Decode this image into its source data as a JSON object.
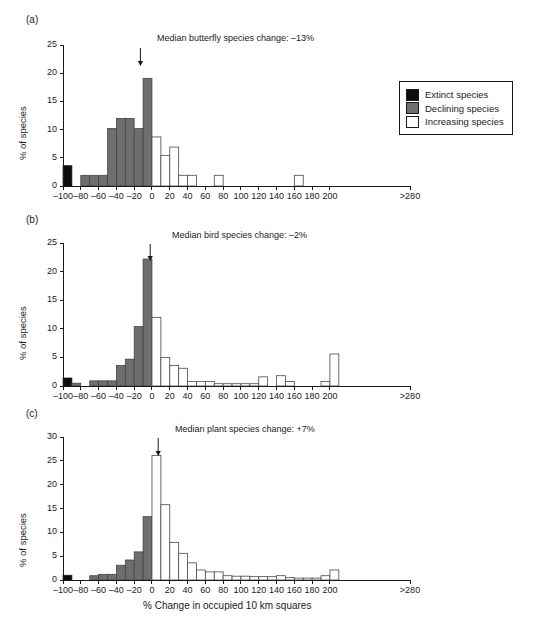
{
  "figure": {
    "xlabel": "% Change in occupied 10 km squares",
    "legend": {
      "items": [
        {
          "label": "Extinct species",
          "color": "#0d0d0d",
          "key": "extinct"
        },
        {
          "label": "Declining species",
          "color": "#6e6e6e",
          "key": "declining"
        },
        {
          "label": "Increasing species",
          "color": "#ffffff",
          "key": "increasing"
        }
      ]
    }
  },
  "chart_data": [
    {
      "type": "bar",
      "panel": "(a)",
      "title": "Median butterfly species change: –13%",
      "median": -13,
      "ylabel": "% of species",
      "xlabel": "",
      "ylim": [
        0,
        25
      ],
      "yticks": [
        0,
        5,
        10,
        15,
        20,
        25
      ],
      "yticklabels": [
        "0",
        "5",
        "10",
        "15",
        "20",
        "25"
      ],
      "xlim": [
        -100,
        290
      ],
      "xticks": [
        -100,
        -80,
        -60,
        -40,
        -20,
        0,
        20,
        40,
        60,
        80,
        100,
        120,
        140,
        160,
        180,
        200,
        290
      ],
      "xticklabels": [
        "–100",
        "–80",
        "–60",
        "–40",
        "–20",
        "0",
        "20",
        "40",
        "60",
        "80",
        "100",
        "120",
        "140",
        "160",
        "180",
        "200",
        ">280"
      ],
      "bin_width": 10,
      "bins": [
        {
          "x0": -100,
          "x1": -90,
          "value": 3.6,
          "cls": "extinct"
        },
        {
          "x0": -90,
          "x1": -80,
          "value": 0,
          "cls": "declining"
        },
        {
          "x0": -80,
          "x1": -70,
          "value": 1.9,
          "cls": "declining"
        },
        {
          "x0": -70,
          "x1": -60,
          "value": 1.9,
          "cls": "declining"
        },
        {
          "x0": -60,
          "x1": -50,
          "value": 1.9,
          "cls": "declining"
        },
        {
          "x0": -50,
          "x1": -40,
          "value": 10.2,
          "cls": "declining"
        },
        {
          "x0": -40,
          "x1": -30,
          "value": 12.0,
          "cls": "declining"
        },
        {
          "x0": -30,
          "x1": -20,
          "value": 12.0,
          "cls": "declining"
        },
        {
          "x0": -20,
          "x1": -10,
          "value": 10.2,
          "cls": "declining"
        },
        {
          "x0": -10,
          "x1": 0,
          "value": 19.1,
          "cls": "declining"
        },
        {
          "x0": 0,
          "x1": 10,
          "value": 8.7,
          "cls": "increasing"
        },
        {
          "x0": 10,
          "x1": 20,
          "value": 5.4,
          "cls": "increasing"
        },
        {
          "x0": 20,
          "x1": 30,
          "value": 6.9,
          "cls": "increasing"
        },
        {
          "x0": 30,
          "x1": 40,
          "value": 1.9,
          "cls": "increasing"
        },
        {
          "x0": 40,
          "x1": 50,
          "value": 1.9,
          "cls": "increasing"
        },
        {
          "x0": 70,
          "x1": 80,
          "value": 1.9,
          "cls": "increasing"
        },
        {
          "x0": 160,
          "x1": 170,
          "value": 1.9,
          "cls": "increasing"
        }
      ]
    },
    {
      "type": "bar",
      "panel": "(b)",
      "title": "Median bird species change: –2%",
      "median": -2,
      "ylabel": "% of species",
      "xlabel": "",
      "ylim": [
        0,
        25
      ],
      "yticks": [
        0,
        5,
        10,
        15,
        20,
        25
      ],
      "yticklabels": [
        "0",
        "5",
        "10",
        "15",
        "20",
        "25"
      ],
      "xlim": [
        -100,
        290
      ],
      "xticks": [
        -100,
        -80,
        -60,
        -40,
        -20,
        0,
        20,
        40,
        60,
        80,
        100,
        120,
        140,
        160,
        180,
        200,
        290
      ],
      "xticklabels": [
        "–100",
        "–80",
        "–60",
        "–40",
        "–20",
        "0",
        "20",
        "40",
        "60",
        "80",
        "100",
        "120",
        "140",
        "160",
        "180",
        "200",
        ">280"
      ],
      "bin_width": 10,
      "bins": [
        {
          "x0": -100,
          "x1": -90,
          "value": 1.4,
          "cls": "extinct"
        },
        {
          "x0": -90,
          "x1": -80,
          "value": 0.5,
          "cls": "declining"
        },
        {
          "x0": -80,
          "x1": -70,
          "value": 0,
          "cls": "declining"
        },
        {
          "x0": -70,
          "x1": -60,
          "value": 0.9,
          "cls": "declining"
        },
        {
          "x0": -60,
          "x1": -50,
          "value": 0.9,
          "cls": "declining"
        },
        {
          "x0": -50,
          "x1": -40,
          "value": 0.9,
          "cls": "declining"
        },
        {
          "x0": -40,
          "x1": -30,
          "value": 3.6,
          "cls": "declining"
        },
        {
          "x0": -30,
          "x1": -20,
          "value": 4.7,
          "cls": "declining"
        },
        {
          "x0": -20,
          "x1": -10,
          "value": 10.4,
          "cls": "declining"
        },
        {
          "x0": -10,
          "x1": 0,
          "value": 22.2,
          "cls": "declining"
        },
        {
          "x0": 0,
          "x1": 10,
          "value": 12.0,
          "cls": "increasing"
        },
        {
          "x0": 10,
          "x1": 20,
          "value": 5.0,
          "cls": "increasing"
        },
        {
          "x0": 20,
          "x1": 30,
          "value": 3.6,
          "cls": "increasing"
        },
        {
          "x0": 30,
          "x1": 40,
          "value": 3.1,
          "cls": "increasing"
        },
        {
          "x0": 40,
          "x1": 50,
          "value": 0.8,
          "cls": "increasing"
        },
        {
          "x0": 50,
          "x1": 60,
          "value": 0.8,
          "cls": "increasing"
        },
        {
          "x0": 60,
          "x1": 70,
          "value": 0.8,
          "cls": "increasing"
        },
        {
          "x0": 70,
          "x1": 80,
          "value": 0.4,
          "cls": "increasing"
        },
        {
          "x0": 80,
          "x1": 90,
          "value": 0.4,
          "cls": "increasing"
        },
        {
          "x0": 90,
          "x1": 100,
          "value": 0.4,
          "cls": "increasing"
        },
        {
          "x0": 100,
          "x1": 110,
          "value": 0.4,
          "cls": "increasing"
        },
        {
          "x0": 110,
          "x1": 120,
          "value": 0.4,
          "cls": "increasing"
        },
        {
          "x0": 120,
          "x1": 130,
          "value": 1.6,
          "cls": "increasing"
        },
        {
          "x0": 140,
          "x1": 150,
          "value": 1.8,
          "cls": "increasing"
        },
        {
          "x0": 150,
          "x1": 160,
          "value": 0.8,
          "cls": "increasing"
        },
        {
          "x0": 190,
          "x1": 200,
          "value": 0.8,
          "cls": "increasing"
        },
        {
          "x0": 200,
          "x1": 210,
          "value": 5.6,
          "cls": "increasing"
        }
      ]
    },
    {
      "type": "bar",
      "panel": "(c)",
      "title": "Median plant species change: +7%",
      "median": 7,
      "ylabel": "% of species",
      "xlabel": "% Change in occupied 10 km squares",
      "ylim": [
        0,
        30
      ],
      "yticks": [
        0,
        5,
        10,
        15,
        20,
        25,
        30
      ],
      "yticklabels": [
        "0",
        "5",
        "10",
        "15",
        "20",
        "25",
        "30"
      ],
      "xlim": [
        -100,
        290
      ],
      "xticks": [
        -100,
        -80,
        -60,
        -40,
        -20,
        0,
        20,
        40,
        60,
        80,
        100,
        120,
        140,
        160,
        180,
        200,
        290
      ],
      "xticklabels": [
        "–100",
        "–80",
        "–60",
        "–40",
        "–20",
        "0",
        "20",
        "40",
        "60",
        "80",
        "100",
        "120",
        "140",
        "160",
        "180",
        "200",
        ">280"
      ],
      "bin_width": 10,
      "bins": [
        {
          "x0": -100,
          "x1": -90,
          "value": 1.0,
          "cls": "extinct"
        },
        {
          "x0": -90,
          "x1": -80,
          "value": 0,
          "cls": "declining"
        },
        {
          "x0": -80,
          "x1": -70,
          "value": 0,
          "cls": "declining"
        },
        {
          "x0": -70,
          "x1": -60,
          "value": 0.9,
          "cls": "declining"
        },
        {
          "x0": -60,
          "x1": -50,
          "value": 1.2,
          "cls": "declining"
        },
        {
          "x0": -50,
          "x1": -40,
          "value": 1.2,
          "cls": "declining"
        },
        {
          "x0": -40,
          "x1": -30,
          "value": 3.1,
          "cls": "declining"
        },
        {
          "x0": -30,
          "x1": -20,
          "value": 4.2,
          "cls": "declining"
        },
        {
          "x0": -20,
          "x1": -10,
          "value": 5.9,
          "cls": "declining"
        },
        {
          "x0": -10,
          "x1": 0,
          "value": 13.3,
          "cls": "declining"
        },
        {
          "x0": 0,
          "x1": 10,
          "value": 26.1,
          "cls": "increasing"
        },
        {
          "x0": 10,
          "x1": 20,
          "value": 15.8,
          "cls": "increasing"
        },
        {
          "x0": 20,
          "x1": 30,
          "value": 7.9,
          "cls": "increasing"
        },
        {
          "x0": 30,
          "x1": 40,
          "value": 5.6,
          "cls": "increasing"
        },
        {
          "x0": 40,
          "x1": 50,
          "value": 3.6,
          "cls": "increasing"
        },
        {
          "x0": 50,
          "x1": 60,
          "value": 2.1,
          "cls": "increasing"
        },
        {
          "x0": 60,
          "x1": 70,
          "value": 1.7,
          "cls": "increasing"
        },
        {
          "x0": 70,
          "x1": 80,
          "value": 1.7,
          "cls": "increasing"
        },
        {
          "x0": 80,
          "x1": 90,
          "value": 0.9,
          "cls": "increasing"
        },
        {
          "x0": 90,
          "x1": 100,
          "value": 0.8,
          "cls": "increasing"
        },
        {
          "x0": 100,
          "x1": 110,
          "value": 0.8,
          "cls": "increasing"
        },
        {
          "x0": 110,
          "x1": 120,
          "value": 0.7,
          "cls": "increasing"
        },
        {
          "x0": 120,
          "x1": 130,
          "value": 0.7,
          "cls": "increasing"
        },
        {
          "x0": 130,
          "x1": 140,
          "value": 0.7,
          "cls": "increasing"
        },
        {
          "x0": 140,
          "x1": 150,
          "value": 0.9,
          "cls": "increasing"
        },
        {
          "x0": 150,
          "x1": 160,
          "value": 0.5,
          "cls": "increasing"
        },
        {
          "x0": 160,
          "x1": 170,
          "value": 0.4,
          "cls": "increasing"
        },
        {
          "x0": 170,
          "x1": 180,
          "value": 0.4,
          "cls": "increasing"
        },
        {
          "x0": 180,
          "x1": 190,
          "value": 0.4,
          "cls": "increasing"
        },
        {
          "x0": 190,
          "x1": 200,
          "value": 0.9,
          "cls": "increasing"
        },
        {
          "x0": 200,
          "x1": 210,
          "value": 2.1,
          "cls": "increasing"
        }
      ]
    }
  ]
}
